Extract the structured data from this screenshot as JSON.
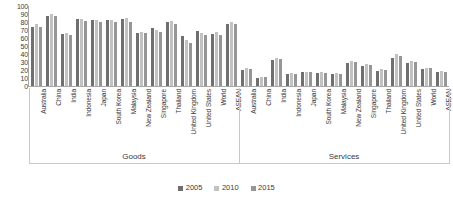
{
  "chart_data": {
    "type": "bar",
    "title": "",
    "xlabel": "",
    "ylabel": "",
    "ylim": [
      0,
      100
    ],
    "yticks": [
      0,
      10,
      20,
      30,
      40,
      50,
      60,
      70,
      80,
      90,
      100
    ],
    "grid": false,
    "legend_position": "bottom",
    "series_names": [
      "2005",
      "2010",
      "2015"
    ],
    "series_colors": [
      "#6f6f6f",
      "#c2c2c2",
      "#969696"
    ],
    "group_labels": [
      "Goods",
      "Services"
    ],
    "categories": [
      "Australia",
      "China",
      "India",
      "Indonesia",
      "Japan",
      "South Korea",
      "Malaysia",
      "New Zealand",
      "Singapore",
      "Thailand",
      "United Kingdom",
      "United States",
      "World",
      "ASEAN"
    ],
    "groups": [
      {
        "name": "Goods",
        "categories": [
          "Australia",
          "China",
          "India",
          "Indonesia",
          "Japan",
          "South Korea",
          "Malaysia",
          "New Zealand",
          "Singapore",
          "Thailand",
          "United Kingdom",
          "United States",
          "World",
          "ASEAN"
        ],
        "series": [
          {
            "name": "2005",
            "values": [
              74,
              88,
              65,
              84,
              82,
              82,
              84,
              66,
              73,
              80,
              62,
              69,
              65,
              77
            ]
          },
          {
            "name": "2010",
            "values": [
              78,
              90,
              66,
              84,
              83,
              83,
              85,
              68,
              70,
              81,
              57,
              66,
              67,
              80
            ]
          },
          {
            "name": "2015",
            "values": [
              74,
              88,
              64,
              81,
              80,
              80,
              80,
              66,
              68,
              77,
              54,
              64,
              64,
              78
            ]
          }
        ]
      },
      {
        "name": "Services",
        "categories": [
          "Australia",
          "China",
          "India",
          "Indonesia",
          "Japan",
          "South Korea",
          "Malaysia",
          "New Zealand",
          "Singapore",
          "Thailand",
          "United Kingdom",
          "United States",
          "World",
          "ASEAN"
        ],
        "series": [
          {
            "name": "2005",
            "values": [
              20,
              10,
              33,
              15,
              17,
              16,
              15,
              29,
              25,
              19,
              35,
              29,
              21,
              18
            ]
          },
          {
            "name": "2010",
            "values": [
              22,
              11,
              35,
              16,
              18,
              17,
              16,
              31,
              27,
              21,
              40,
              31,
              23,
              19
            ]
          },
          {
            "name": "2015",
            "values": [
              21,
              11,
              34,
              15,
              17,
              16,
              15,
              30,
              26,
              20,
              38,
              30,
              22,
              18
            ]
          }
        ]
      }
    ]
  },
  "legend": {
    "items": [
      {
        "label": "2005",
        "color": "#6f6f6f"
      },
      {
        "label": "2010",
        "color": "#c2c2c2"
      },
      {
        "label": "2015",
        "color": "#969696"
      }
    ]
  }
}
